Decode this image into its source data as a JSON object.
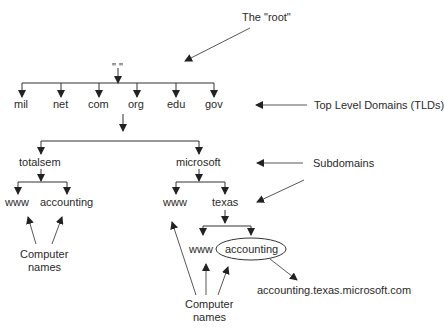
{
  "diagram": {
    "type": "DNS hierarchy tree",
    "root_label": "The \"root\"",
    "root_node": "\" \"",
    "tlds": [
      "mil",
      "net",
      "com",
      "org",
      "edu",
      "gov"
    ],
    "tld_label": "Top Level Domains (TLDs)",
    "second_level": [
      "totalsem",
      "microsoft"
    ],
    "subdomains_label": "Subdomains",
    "totalsem_children": [
      "www",
      "accounting"
    ],
    "microsoft_children": [
      "www",
      "texas"
    ],
    "texas_children": [
      "www",
      "accounting"
    ],
    "computer_names_left": [
      "Computer",
      "names"
    ],
    "computer_names_right": [
      "Computer",
      "names"
    ],
    "fqdn": "accounting.texas.microsoft.com"
  }
}
